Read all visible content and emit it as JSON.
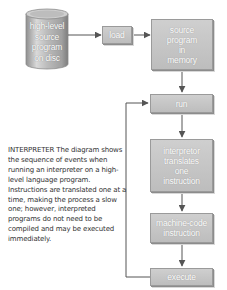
{
  "diagram": {
    "type": "flowchart",
    "title": "INTERPRETER",
    "nodes": {
      "disc": {
        "label": "high-level\nsource\nprogram\non disc",
        "shape": "cylinder"
      },
      "load": {
        "label": "load",
        "shape": "box"
      },
      "memory": {
        "label": "source\nprogram\nin\nmemory",
        "shape": "box"
      },
      "run": {
        "label": "run",
        "shape": "box"
      },
      "translate": {
        "label": "interpretor\ntranslates\none\ninstruction",
        "shape": "box"
      },
      "machine": {
        "label": "machine-code\ninstruction",
        "shape": "box"
      },
      "execute": {
        "label": "execute",
        "shape": "box"
      }
    },
    "edges": [
      {
        "from": "disc",
        "to": "load"
      },
      {
        "from": "load",
        "to": "memory"
      },
      {
        "from": "memory",
        "to": "run"
      },
      {
        "from": "run",
        "to": "translate"
      },
      {
        "from": "translate",
        "to": "machine"
      },
      {
        "from": "machine",
        "to": "execute"
      },
      {
        "from": "execute",
        "to": "run",
        "note": "loop back"
      }
    ],
    "colors": {
      "box_fill": "#c6c6c6",
      "box_border": "#9a9a9a",
      "arrow": "#555555",
      "label_text": "#ffffff",
      "caption_text": "#333333"
    }
  },
  "caption": {
    "heading": "INTERPRETER",
    "text": " The diagram shows the sequence of events when running an interpreter on a high-level language program. Instructions are translated one at a time, making the process a slow one; however, interpreted programs do not need to be compiled and may be executed immediately."
  }
}
